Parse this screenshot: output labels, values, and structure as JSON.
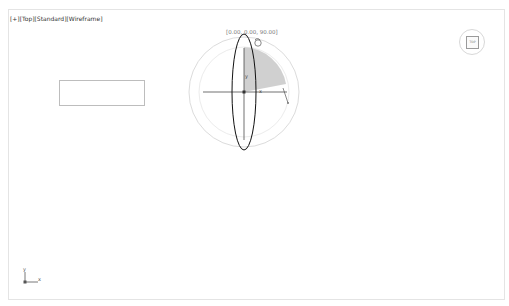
{
  "viewport": {
    "label_parts": [
      "[+]",
      "[Top]",
      "[Standard]",
      "[Wireframe]"
    ],
    "name": "Top"
  },
  "gizmo": {
    "type": "rotate",
    "coord_readout": "[0.00, 0.00, 90.00]",
    "axis_labels": {
      "x": "x",
      "y": "y",
      "z": "z"
    },
    "wedge_color": "#c8c8c8"
  },
  "viewcube": {
    "face_label": "TOP"
  },
  "axis_tripod": {
    "x": "x",
    "y": "y"
  },
  "colors": {
    "background": "#ffffff",
    "border": "#e4e4e4",
    "ellipse": "#111111",
    "circle": "#dcdcdc"
  }
}
